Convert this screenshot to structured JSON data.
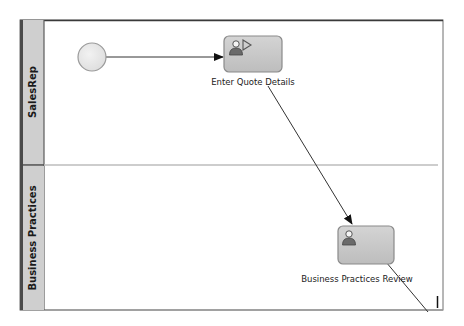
{
  "diagram": {
    "type": "swimlane-process",
    "lanes": [
      {
        "name": "SalesRep"
      },
      {
        "name": "Business Practices"
      }
    ],
    "nodes": [
      {
        "id": "start",
        "kind": "start-event",
        "lane": "SalesRep",
        "label": ""
      },
      {
        "id": "enter-quote-details",
        "kind": "user-task",
        "lane": "SalesRep",
        "label": "Enter Quote Details",
        "icons": [
          "person-icon",
          "play-icon"
        ]
      },
      {
        "id": "business-practices-review",
        "kind": "user-task",
        "lane": "Business Practices",
        "label": "Business Practices Review",
        "icons": [
          "person-icon"
        ]
      }
    ],
    "edges": [
      {
        "from": "start",
        "to": "enter-quote-details"
      },
      {
        "from": "enter-quote-details",
        "to": "business-practices-review"
      },
      {
        "from": "business-practices-review",
        "to": "offscreen"
      }
    ],
    "colors": {
      "lane_header": "#cfcfcf",
      "lane_header_border": "#4a4a4a",
      "task_fill": "#c4c4c4",
      "task_border": "#8a8a8a",
      "start_fill": "#e6e6e6",
      "edge": "#333333",
      "lane_divider": "#b8b8b8"
    }
  }
}
